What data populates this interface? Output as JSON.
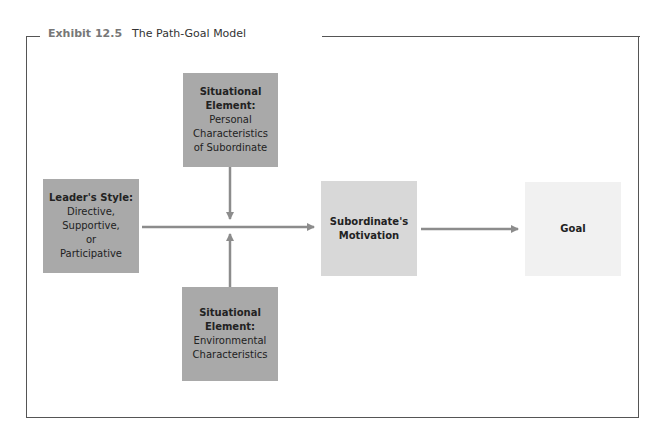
{
  "exhibit": {
    "number": "Exhibit 12.5",
    "title": "The Path-Goal Model"
  },
  "boxes": {
    "personal": {
      "bold": [
        "Situational",
        "Element:"
      ],
      "normal": [
        "Personal",
        "Characteristics",
        "of Subordinate"
      ]
    },
    "leader": {
      "bold": [
        "Leader's Style:"
      ],
      "normal": [
        "Directive,",
        "Supportive,",
        "or",
        "Participative"
      ]
    },
    "motivation": {
      "bold": [
        "Subordinate's",
        "Motivation"
      ],
      "normal": []
    },
    "goal": {
      "bold": [
        "Goal"
      ],
      "normal": []
    },
    "environmental": {
      "bold": [
        "Situational",
        "Element:"
      ],
      "normal": [
        "Environmental",
        "Characteristics"
      ]
    }
  },
  "colors": {
    "dark_box": "#a9a9a9",
    "mid_box": "#d8d8d8",
    "light_box": "#f1f1f1",
    "arrow": "#8c8c8c"
  }
}
